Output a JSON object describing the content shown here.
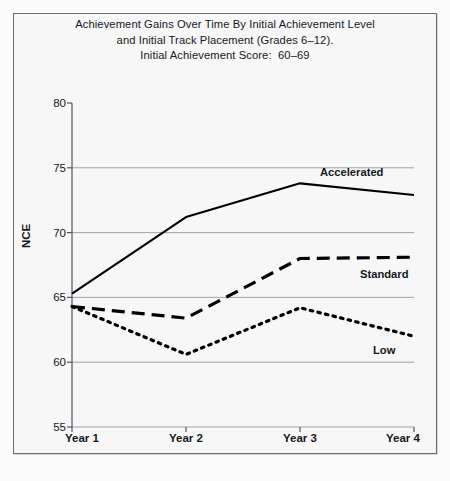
{
  "title": {
    "line1": "Achievement Gains Over Time By Initial Achievement Level",
    "line2": "and Initial Track Placement (Grades 6–12).",
    "line3": "Initial Achievement Score:  60–69"
  },
  "caption": "",
  "colors": {
    "page_background": "#fbfbfb",
    "plot_background": "#f7f7f7",
    "frame_border": "#6b6b6b",
    "gridline": "#999999",
    "axis": "#555555",
    "series": "#000000",
    "text": "#14181c"
  },
  "chart_data": {
    "type": "line",
    "title": "Achievement Gains Over Time By Initial Achievement Level and Initial Track Placement (Grades 6–12). Initial Achievement Score:  60–69",
    "xlabel": "",
    "ylabel": "NCE",
    "categories": [
      "Year 1",
      "Year 2",
      "Year 3",
      "Year 4"
    ],
    "ylim": [
      55,
      80
    ],
    "yticks": [
      55,
      60,
      65,
      70,
      75,
      80
    ],
    "grid": true,
    "legend": "inline-right-of-series",
    "series": [
      {
        "name": "Accelerated",
        "style": "solid",
        "label_x": "Year 3",
        "values": [
          65.3,
          71.2,
          73.8,
          72.9
        ]
      },
      {
        "name": "Standard",
        "style": "dashed",
        "label_x": "Year 4",
        "values": [
          64.3,
          63.4,
          68.0,
          68.1
        ]
      },
      {
        "name": "Low",
        "style": "dotted",
        "label_x": "Year 4",
        "values": [
          64.3,
          60.6,
          64.2,
          62.0
        ]
      }
    ]
  }
}
